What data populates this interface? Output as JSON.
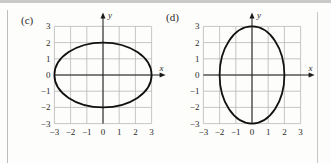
{
  "chart_data": [
    {
      "type": "line",
      "panel_label": "(c)",
      "title": "",
      "xlabel": "x",
      "ylabel": "y",
      "xlim": [
        -3,
        3
      ],
      "ylim": [
        -3,
        3
      ],
      "grid": true,
      "x_ticks": [
        "−3",
        "−2",
        "−1",
        "0",
        "1",
        "2",
        "3"
      ],
      "y_ticks": [
        "3",
        "2",
        "1",
        "0",
        "−1",
        "−2",
        "−3"
      ],
      "curve": {
        "shape": "ellipse",
        "center": [
          0,
          0
        ],
        "semi_axis_x": 3,
        "semi_axis_y": 2,
        "equation": "x^2/9 + y^2/4 = 1"
      }
    },
    {
      "type": "line",
      "panel_label": "(d)",
      "title": "",
      "xlabel": "x",
      "ylabel": "y",
      "xlim": [
        -3,
        3
      ],
      "ylim": [
        -3,
        3
      ],
      "grid": true,
      "x_ticks": [
        "−3",
        "−2",
        "−1",
        "0",
        "1",
        "2",
        "3"
      ],
      "y_ticks": [
        "3",
        "2",
        "1",
        "0",
        "−1",
        "−2",
        "−3"
      ],
      "curve": {
        "shape": "ellipse",
        "center": [
          0,
          0
        ],
        "semi_axis_x": 2,
        "semi_axis_y": 3,
        "equation": "x^2/4 + y^2/9 = 1"
      }
    }
  ],
  "colors": {
    "grid": "#b8b8b8",
    "axis": "#1a1a1a",
    "curve": "#111111",
    "text": "#2a2a2a"
  }
}
